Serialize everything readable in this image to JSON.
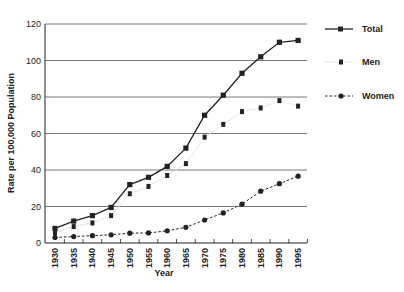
{
  "chart_data": {
    "type": "line",
    "title": "",
    "xlabel": "Year",
    "ylabel": "Rate per 100,000 Population",
    "ylim": [
      0,
      120
    ],
    "yticks": [
      0,
      20,
      40,
      60,
      80,
      100,
      120
    ],
    "grid": "horizontal",
    "legend_position": "right",
    "x": [
      1930,
      1935,
      1940,
      1945,
      1950,
      1955,
      1960,
      1965,
      1970,
      1975,
      1980,
      1985,
      1990,
      1995
    ],
    "series": [
      {
        "name": "Total",
        "style": "solid line with square markers",
        "values": [
          8,
          12,
          15,
          19.5,
          32,
          36,
          42,
          52,
          70,
          81,
          93,
          102,
          110,
          111
        ]
      },
      {
        "name": "Men",
        "style": "square markers (faint line)",
        "values": [
          5.5,
          9,
          11,
          15,
          27,
          31,
          37,
          43.5,
          58,
          65,
          72,
          74,
          78,
          75
        ]
      },
      {
        "name": "Women",
        "style": "dashed line with circle markers",
        "values": [
          3,
          3.5,
          4,
          4.5,
          5.4,
          5.5,
          6.7,
          8.6,
          12.6,
          16.5,
          21.3,
          28.4,
          32.5,
          36.6
        ]
      }
    ]
  },
  "axes": {
    "xlabel": "Year",
    "ylabel": "Rate per 100,000 Population"
  },
  "legend": {
    "total": "Total",
    "men": "Men",
    "women": "Women"
  },
  "colors": {
    "line": "#222222",
    "grid": "#555555",
    "men_line": "#e6e6e6"
  }
}
